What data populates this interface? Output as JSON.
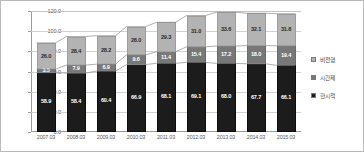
{
  "chart_data": {
    "type": "bar",
    "subtype": "stacked-column-with-lines",
    "title": "",
    "xlabel": "",
    "ylabel": "",
    "ylim": [
      0,
      120
    ],
    "ytick_step": 20,
    "ytick_labels": [
      "120.0",
      "100.0",
      "80.0",
      "60.0",
      "40.0",
      "20.0",
      "0.0"
    ],
    "ytick_values": [
      120,
      100,
      80,
      60,
      40,
      20,
      0
    ],
    "grid": true,
    "legend_position": "right",
    "categories": [
      "2007.03",
      "2008.03",
      "2009.03",
      "2010.03",
      "2011.03",
      "2012.03",
      "2013.03",
      "2014.03",
      "2015.03"
    ],
    "series": [
      {
        "name": "한시적",
        "stack_order": 0,
        "color": "#1c1c1c",
        "values": [
          58.9,
          58.4,
          60.4,
          66.9,
          68.1,
          69.1,
          68.0,
          67.7,
          66.1
        ]
      },
      {
        "name": "시간제",
        "stack_order": 1,
        "color": "#787878",
        "values": [
          3.5,
          7.9,
          6.9,
          9.6,
          11.4,
          15.4,
          17.2,
          18.0,
          19.4
        ]
      },
      {
        "name": "비전형",
        "stack_order": 2,
        "color": "#b3b3b3",
        "values": [
          26.0,
          28.4,
          28.2,
          28.0,
          29.3,
          31.0,
          33.6,
          32.1,
          31.8
        ]
      }
    ],
    "stack_totals": [
      88.4,
      94.7,
      95.5,
      104.5,
      108.8,
      115.5,
      118.8,
      117.8,
      117.3
    ],
    "cumulative_lines": [
      {
        "name": "한시적 누계",
        "values": [
          58.9,
          58.4,
          60.4,
          66.9,
          68.1,
          69.1,
          68.0,
          67.7,
          66.1
        ]
      },
      {
        "name": "한시적+시간제 누계",
        "values": [
          62.4,
          66.3,
          67.3,
          76.5,
          79.5,
          84.5,
          85.2,
          85.7,
          85.5
        ]
      },
      {
        "name": "전체 누계",
        "values": [
          88.4,
          94.7,
          95.5,
          104.5,
          108.8,
          115.5,
          118.8,
          117.8,
          117.3
        ]
      }
    ]
  },
  "legend": {
    "items": [
      {
        "label": "비전형",
        "color": "#b3b3b3"
      },
      {
        "label": "시간제",
        "color": "#787878"
      },
      {
        "label": "한시적",
        "color": "#1c1c1c"
      }
    ]
  }
}
